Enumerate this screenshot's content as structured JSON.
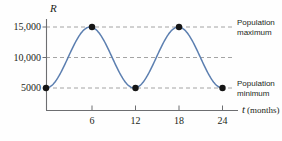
{
  "chart_data": {
    "type": "line",
    "title": "",
    "subtitle": "",
    "xlabel": "t (months)",
    "ylabel": "R",
    "x": [
      0,
      1,
      2,
      3,
      4,
      5,
      6,
      7,
      8,
      9,
      10,
      11,
      12,
      13,
      14,
      15,
      16,
      17,
      18,
      19,
      20,
      21,
      22,
      23,
      24
    ],
    "values": [
      5000,
      5670,
      7500,
      10000,
      12500,
      14330,
      15000,
      14330,
      12500,
      10000,
      7500,
      5670,
      5000,
      5670,
      7500,
      10000,
      12500,
      14330,
      15000,
      14330,
      12500,
      10000,
      7500,
      5670,
      5000
    ],
    "series": [
      {
        "name": "R(t)",
        "values": [
          5000,
          5670,
          7500,
          10000,
          12500,
          14330,
          15000,
          14330,
          12500,
          10000,
          7500,
          5670,
          5000,
          5670,
          7500,
          10000,
          12500,
          14330,
          15000,
          14330,
          12500,
          10000,
          7500,
          5670,
          5000
        ]
      }
    ],
    "xlim": [
      0,
      25.5
    ],
    "ylim": [
      2800,
      16500
    ],
    "grid": true,
    "gridlines_y": [
      5000,
      10000,
      15000
    ],
    "legend_position": "none",
    "curve_color": "#5c7fb0",
    "marker_color": "#1a1a1a",
    "axis_color": "#6d6e71",
    "gridline_color": "#9a9a9a",
    "markers": [
      {
        "x": 0,
        "y": 5000,
        "label": "minimum"
      },
      {
        "x": 6,
        "y": 15000,
        "label": "maximum"
      },
      {
        "x": 12,
        "y": 5000,
        "label": "minimum"
      },
      {
        "x": 18,
        "y": 15000,
        "label": "maximum"
      },
      {
        "x": 24,
        "y": 5000,
        "label": "minimum"
      }
    ],
    "y_ticks": [
      {
        "value": 5000,
        "label": "5000"
      },
      {
        "value": 10000,
        "label": "10,000"
      },
      {
        "value": 15000,
        "label": "15,000"
      }
    ],
    "x_ticks": [
      {
        "value": 6,
        "label": "6"
      },
      {
        "value": 12,
        "label": "12"
      },
      {
        "value": 18,
        "label": "18"
      },
      {
        "value": 24,
        "label": "24"
      }
    ],
    "annotations": [
      {
        "name": "population-maximum",
        "line1": "Population",
        "line2": "maximum",
        "at_y": 15000
      },
      {
        "name": "population-minimum",
        "line1": "Population",
        "line2": "minimum",
        "at_y": 5000
      }
    ]
  },
  "axes": {
    "y_axis_symbol": "R",
    "x_axis_symbol": "t",
    "x_axis_unit": "(months)"
  },
  "y_tick_labels": {
    "t15000": "15,000",
    "t10000": "10,000",
    "t5000": "5000"
  },
  "x_tick_labels": {
    "t6": "6",
    "t12": "12",
    "t18": "18",
    "t24": "24"
  },
  "annotations": {
    "max_line1": "Population",
    "max_line2": "maximum",
    "min_line1": "Population",
    "min_line2": "minimum"
  }
}
